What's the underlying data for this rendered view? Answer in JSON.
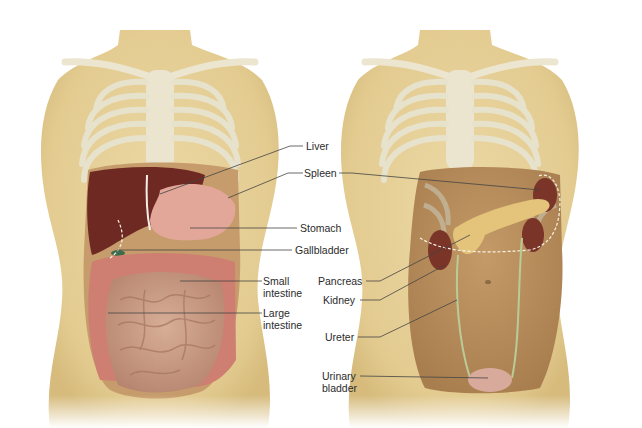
{
  "figure": {
    "left_panel": {
      "name": "Digestive organs (anterior view)",
      "labels": [
        {
          "id": "liver",
          "text": "Liver"
        },
        {
          "id": "spleen",
          "text": "Spleen"
        },
        {
          "id": "stomach",
          "text": "Stomach"
        },
        {
          "id": "gallbladder",
          "text": "Gallbladder"
        },
        {
          "id": "small_intestine_l1",
          "text": "Small"
        },
        {
          "id": "small_intestine_l2",
          "text": "intestine"
        },
        {
          "id": "large_intestine_l1",
          "text": "Large"
        },
        {
          "id": "large_intestine_l2",
          "text": "intestine"
        }
      ]
    },
    "right_panel": {
      "name": "Retroperitoneal organs (anterior view)",
      "labels": [
        {
          "id": "pancreas",
          "text": "Pancreas"
        },
        {
          "id": "kidney",
          "text": "Kidney"
        },
        {
          "id": "ureter",
          "text": "Ureter"
        },
        {
          "id": "urinary_bladder_l1",
          "text": "Urinary"
        },
        {
          "id": "urinary_bladder_l2",
          "text": "bladder"
        }
      ]
    }
  },
  "colors": {
    "skin": "#e8d39c",
    "skin_shadow": "#d9bf82",
    "bone": "#e9e3cc",
    "bone_shadow": "#b9cfd2",
    "liver": "#6e2a22",
    "stomach": "#e3a79a",
    "intestine": "#c9987f",
    "large_intestine": "#cf7f72",
    "cavity": "#b98c5c",
    "kidney": "#7a3428",
    "pancreas": "#e3c47a",
    "ureter": "#b9cc98",
    "bladder": "#d8aa9c",
    "leader_line": "#444444"
  }
}
